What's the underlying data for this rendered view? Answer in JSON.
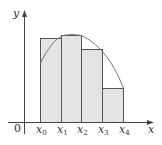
{
  "diagram": {
    "axes": {
      "x_label": "x",
      "y_label": "y",
      "origin_label": "0"
    },
    "partition_labels": [
      {
        "base": "x",
        "sub": "0"
      },
      {
        "base": "x",
        "sub": "1"
      },
      {
        "base": "x",
        "sub": "2"
      },
      {
        "base": "x",
        "sub": "3"
      },
      {
        "base": "x",
        "sub": "4"
      }
    ],
    "rectangles": [
      {
        "from": "x0",
        "to": "x1",
        "relative_height": 0.84
      },
      {
        "from": "x1",
        "to": "x2",
        "relative_height": 0.88
      },
      {
        "from": "x2",
        "to": "x3",
        "relative_height": 0.73
      },
      {
        "from": "x3",
        "to": "x4",
        "relative_height": 0.35
      }
    ],
    "colors": {
      "rect_fill": "#e4e4e4",
      "rect_stroke": "#555555",
      "curve": "#777777",
      "axis": "#444444",
      "background": "#ffffff"
    }
  }
}
